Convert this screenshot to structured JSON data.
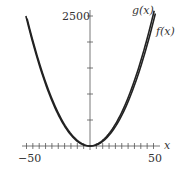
{
  "chart_data": {
    "type": "line",
    "title": "",
    "xlabel": "x",
    "ylabel": "",
    "xlim": [
      -52,
      56
    ],
    "ylim": [
      0,
      2600
    ],
    "x_tick_labels": [
      "-50",
      "50"
    ],
    "y_tick_labels": [
      "2500"
    ],
    "x_ticks": [
      -50,
      -40,
      -30,
      -20,
      -10,
      0,
      10,
      20,
      30,
      40,
      50
    ],
    "y_ticks": [
      500,
      1000,
      1500,
      2000,
      2500
    ],
    "grid": false,
    "series": [
      {
        "name": "g(x)",
        "formula": "x^2 + small offset",
        "x": [
          -50,
          -25,
          0,
          25,
          50
        ],
        "y": [
          2500,
          625,
          0,
          625,
          2500
        ]
      },
      {
        "name": "f(x)",
        "formula": "x^2",
        "x": [
          -50,
          -25,
          0,
          25,
          50
        ],
        "y": [
          2450,
          610,
          0,
          610,
          2450
        ]
      }
    ],
    "annotations": [
      "g(x)",
      "f(x)"
    ]
  },
  "labels": {
    "g": "g(x)",
    "f": "f(x)",
    "x_axis": "x",
    "x_min": "−50",
    "x_max": "50",
    "y_max": "2500"
  }
}
